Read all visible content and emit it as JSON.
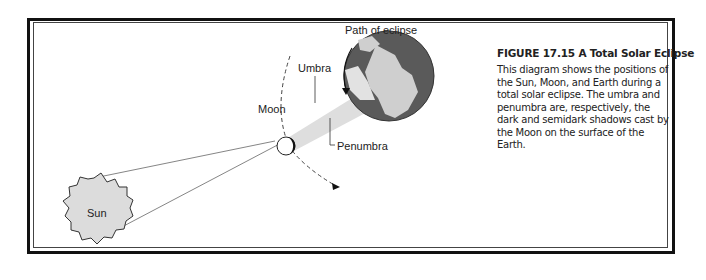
{
  "figure": {
    "title": "FIGURE 17.15  A Total Solar Eclipse",
    "caption": "This diagram shows the positions of the Sun, Moon, and Earth during a total solar eclipse. The umbra and penumbra are, respectively, the dark and semidark shadows cast by the Moon on the surface of the Earth."
  },
  "labels": {
    "sun": "Sun",
    "moon": "Moon",
    "umbra": "Umbra",
    "penumbra": "Penumbra",
    "path": "Path of eclipse"
  },
  "colors": {
    "frame": "#111111",
    "sun_fill": "#d9d9d9",
    "earth_dark": "#555555",
    "earth_light": "#cfcfcf",
    "shadow": "#d8d8d8"
  }
}
